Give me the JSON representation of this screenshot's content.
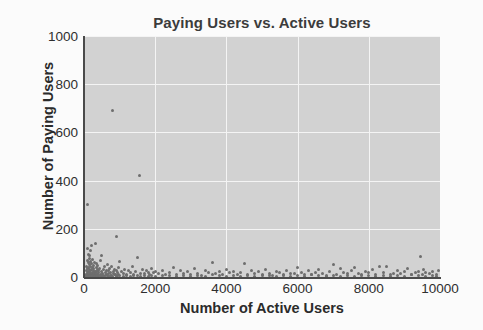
{
  "chart_data": {
    "type": "scatter",
    "title": "Paying Users vs. Active Users",
    "xlabel": "Number of Active Users",
    "ylabel": "Number of Paying Users",
    "xlim": [
      0,
      10000
    ],
    "ylim": [
      0,
      1000
    ],
    "xticks": [
      0,
      2000,
      4000,
      6000,
      8000,
      10000
    ],
    "yticks": [
      0,
      200,
      400,
      600,
      800,
      1000
    ],
    "xticklabels": [
      "0",
      "2000",
      "4000",
      "6000",
      "8000",
      "10000"
    ],
    "yticklabels": [
      "0",
      "200",
      "400",
      "600",
      "800",
      "1000"
    ],
    "grid": true,
    "grid_color": "#f4f4f4",
    "plot_background": "#d2d2d2",
    "marker_color": "#6e6e6e",
    "marker_size": 3,
    "legend": null,
    "series": [
      {
        "name": "accounts",
        "points": [
          [
            60,
            12
          ],
          [
            70,
            28
          ],
          [
            75,
            5
          ],
          [
            80,
            45
          ],
          [
            85,
            18
          ],
          [
            90,
            300
          ],
          [
            95,
            70
          ],
          [
            100,
            8
          ],
          [
            105,
            120
          ],
          [
            110,
            35
          ],
          [
            115,
            22
          ],
          [
            120,
            95
          ],
          [
            125,
            60
          ],
          [
            130,
            15
          ],
          [
            135,
            40
          ],
          [
            140,
            10
          ],
          [
            145,
            78
          ],
          [
            150,
            30
          ],
          [
            155,
            52
          ],
          [
            160,
            20
          ],
          [
            165,
            88
          ],
          [
            170,
            6
          ],
          [
            175,
            110
          ],
          [
            180,
            25
          ],
          [
            185,
            44
          ],
          [
            190,
            14
          ],
          [
            195,
            66
          ],
          [
            200,
            33
          ],
          [
            210,
            9
          ],
          [
            215,
            58
          ],
          [
            220,
            130
          ],
          [
            225,
            20
          ],
          [
            230,
            41
          ],
          [
            240,
            16
          ],
          [
            250,
            72
          ],
          [
            255,
            27
          ],
          [
            260,
            11
          ],
          [
            270,
            49
          ],
          [
            280,
            34
          ],
          [
            290,
            19
          ],
          [
            300,
            62
          ],
          [
            310,
            24
          ],
          [
            320,
            140
          ],
          [
            330,
            13
          ],
          [
            340,
            38
          ],
          [
            350,
            55
          ],
          [
            360,
            21
          ],
          [
            370,
            30
          ],
          [
            380,
            9
          ],
          [
            390,
            46
          ],
          [
            400,
            17
          ],
          [
            420,
            26
          ],
          [
            440,
            36
          ],
          [
            450,
            12
          ],
          [
            460,
            68
          ],
          [
            480,
            22
          ],
          [
            500,
            90
          ],
          [
            520,
            15
          ],
          [
            540,
            31
          ],
          [
            560,
            8
          ],
          [
            580,
            43
          ],
          [
            600,
            18
          ],
          [
            620,
            25
          ],
          [
            640,
            11
          ],
          [
            660,
            50
          ],
          [
            680,
            29
          ],
          [
            700,
            14
          ],
          [
            720,
            35
          ],
          [
            740,
            20
          ],
          [
            760,
            7
          ],
          [
            780,
            42
          ],
          [
            800,
            690
          ],
          [
            820,
            23
          ],
          [
            840,
            16
          ],
          [
            860,
            30
          ],
          [
            880,
            10
          ],
          [
            900,
            170
          ],
          [
            920,
            27
          ],
          [
            940,
            19
          ],
          [
            960,
            38
          ],
          [
            980,
            12
          ],
          [
            1000,
            64
          ],
          [
            1050,
            22
          ],
          [
            1100,
            15
          ],
          [
            1150,
            33
          ],
          [
            1200,
            9
          ],
          [
            1250,
            28
          ],
          [
            1300,
            18
          ],
          [
            1350,
            45
          ],
          [
            1400,
            11
          ],
          [
            1450,
            24
          ],
          [
            1500,
            80
          ],
          [
            1550,
            420
          ],
          [
            1600,
            16
          ],
          [
            1650,
            31
          ],
          [
            1700,
            13
          ],
          [
            1750,
            26
          ],
          [
            1800,
            20
          ],
          [
            1850,
            10
          ],
          [
            1900,
            37
          ],
          [
            1950,
            17
          ],
          [
            2000,
            23
          ],
          [
            2100,
            14
          ],
          [
            2200,
            29
          ],
          [
            2300,
            12
          ],
          [
            2400,
            19
          ],
          [
            2500,
            40
          ],
          [
            2600,
            9
          ],
          [
            2700,
            25
          ],
          [
            2800,
            16
          ],
          [
            2900,
            21
          ],
          [
            3000,
            11
          ],
          [
            3100,
            34
          ],
          [
            3200,
            15
          ],
          [
            3300,
            8
          ],
          [
            3400,
            27
          ],
          [
            3500,
            18
          ],
          [
            3600,
            60
          ],
          [
            3700,
            13
          ],
          [
            3800,
            22
          ],
          [
            3900,
            10
          ],
          [
            4000,
            30
          ],
          [
            4100,
            17
          ],
          [
            4200,
            24
          ],
          [
            4300,
            12
          ],
          [
            4400,
            19
          ],
          [
            4500,
            55
          ],
          [
            4600,
            9
          ],
          [
            4700,
            26
          ],
          [
            4800,
            15
          ],
          [
            4900,
            21
          ],
          [
            5000,
            11
          ],
          [
            5100,
            32
          ],
          [
            5200,
            14
          ],
          [
            5300,
            8
          ],
          [
            5400,
            23
          ],
          [
            5500,
            18
          ],
          [
            5600,
            10
          ],
          [
            5700,
            28
          ],
          [
            5800,
            16
          ],
          [
            5900,
            13
          ],
          [
            6000,
            38
          ],
          [
            6100,
            20
          ],
          [
            6200,
            9
          ],
          [
            6300,
            25
          ],
          [
            6400,
            12
          ],
          [
            6500,
            17
          ],
          [
            6600,
            30
          ],
          [
            6700,
            14
          ],
          [
            6800,
            8
          ],
          [
            6900,
            22
          ],
          [
            7000,
            50
          ],
          [
            7100,
            11
          ],
          [
            7200,
            35
          ],
          [
            7300,
            19
          ],
          [
            7400,
            13
          ],
          [
            7500,
            27
          ],
          [
            7600,
            40
          ],
          [
            7700,
            15
          ],
          [
            7800,
            9
          ],
          [
            7900,
            23
          ],
          [
            8000,
            18
          ],
          [
            8100,
            31
          ],
          [
            8200,
            12
          ],
          [
            8300,
            45
          ],
          [
            8400,
            20
          ],
          [
            8500,
            42
          ],
          [
            8600,
            10
          ],
          [
            8700,
            16
          ],
          [
            8800,
            26
          ],
          [
            8900,
            13
          ],
          [
            9000,
            21
          ],
          [
            9100,
            34
          ],
          [
            9200,
            9
          ],
          [
            9300,
            17
          ],
          [
            9400,
            24
          ],
          [
            9450,
            85
          ],
          [
            9500,
            12
          ],
          [
            9550,
            30
          ],
          [
            9600,
            19
          ],
          [
            9700,
            14
          ],
          [
            9800,
            22
          ],
          [
            9900,
            10
          ],
          [
            9950,
            28
          ],
          [
            40,
            3
          ],
          [
            55,
            6
          ],
          [
            65,
            2
          ],
          [
            78,
            9
          ],
          [
            88,
            4
          ],
          [
            98,
            7
          ],
          [
            108,
            2
          ],
          [
            118,
            5
          ],
          [
            128,
            8
          ],
          [
            138,
            3
          ],
          [
            148,
            6
          ],
          [
            158,
            4
          ],
          [
            168,
            2
          ],
          [
            178,
            7
          ],
          [
            188,
            5
          ],
          [
            198,
            3
          ],
          [
            208,
            8
          ],
          [
            218,
            4
          ],
          [
            228,
            6
          ],
          [
            238,
            2
          ],
          [
            248,
            5
          ],
          [
            258,
            9
          ],
          [
            268,
            3
          ],
          [
            278,
            7
          ],
          [
            288,
            4
          ],
          [
            298,
            6
          ],
          [
            308,
            2
          ],
          [
            318,
            8
          ],
          [
            328,
            5
          ],
          [
            338,
            3
          ],
          [
            348,
            7
          ],
          [
            358,
            4
          ],
          [
            368,
            9
          ],
          [
            378,
            2
          ],
          [
            388,
            6
          ],
          [
            398,
            5
          ],
          [
            450,
            4
          ],
          [
            500,
            7
          ],
          [
            550,
            3
          ],
          [
            600,
            8
          ],
          [
            650,
            5
          ],
          [
            700,
            2
          ],
          [
            750,
            6
          ],
          [
            800,
            4
          ],
          [
            850,
            9
          ],
          [
            900,
            3
          ],
          [
            950,
            7
          ],
          [
            1000,
            5
          ],
          [
            1100,
            4
          ],
          [
            1200,
            6
          ],
          [
            1300,
            3
          ],
          [
            1400,
            8
          ],
          [
            1500,
            5
          ],
          [
            1600,
            2
          ],
          [
            1700,
            7
          ],
          [
            1800,
            4
          ],
          [
            1900,
            6
          ],
          [
            2000,
            3
          ],
          [
            2200,
            8
          ],
          [
            2400,
            5
          ],
          [
            2600,
            2
          ],
          [
            2800,
            7
          ],
          [
            3000,
            4
          ],
          [
            3200,
            6
          ],
          [
            3400,
            3
          ],
          [
            3600,
            9
          ],
          [
            3800,
            5
          ],
          [
            4000,
            2
          ],
          [
            4200,
            7
          ],
          [
            4400,
            4
          ],
          [
            4600,
            6
          ],
          [
            4800,
            3
          ],
          [
            5000,
            8
          ],
          [
            5200,
            5
          ],
          [
            5400,
            2
          ],
          [
            5600,
            7
          ],
          [
            5800,
            4
          ],
          [
            6000,
            6
          ],
          [
            6200,
            3
          ],
          [
            6400,
            9
          ],
          [
            6600,
            5
          ],
          [
            6800,
            2
          ],
          [
            7000,
            7
          ],
          [
            7200,
            4
          ],
          [
            7400,
            6
          ],
          [
            7600,
            3
          ],
          [
            7800,
            8
          ],
          [
            8000,
            5
          ],
          [
            8200,
            2
          ],
          [
            8400,
            7
          ],
          [
            8600,
            4
          ],
          [
            8800,
            6
          ],
          [
            9000,
            3
          ],
          [
            9200,
            9
          ],
          [
            9400,
            5
          ],
          [
            9600,
            2
          ],
          [
            9800,
            7
          ],
          [
            9900,
            4
          ]
        ]
      }
    ]
  }
}
